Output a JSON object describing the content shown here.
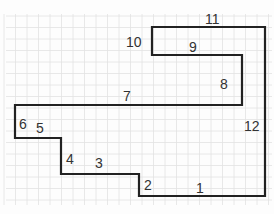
{
  "diagram": {
    "type": "rectilinear-polygon-on-grid-paper",
    "colors": {
      "grid": "#e2e2e2",
      "grid_major": "#d4d4d4",
      "outline": "#222222",
      "label": "#333333",
      "background": "#fdfdfd"
    },
    "vertices": [
      [
        139,
        196
      ],
      [
        265,
        196
      ],
      [
        265,
        27
      ],
      [
        152,
        27
      ],
      [
        152,
        55
      ],
      [
        242,
        55
      ],
      [
        242,
        105
      ],
      [
        15,
        105
      ],
      [
        15,
        138
      ],
      [
        61,
        138
      ],
      [
        61,
        174
      ],
      [
        139,
        174
      ]
    ],
    "side_labels": [
      {
        "id": "1",
        "text": "1",
        "x": 196,
        "y": 193
      },
      {
        "id": "2",
        "text": "2",
        "x": 144,
        "y": 190
      },
      {
        "id": "3",
        "text": "3",
        "x": 95,
        "y": 168
      },
      {
        "id": "4",
        "text": "4",
        "x": 66,
        "y": 164
      },
      {
        "id": "5",
        "text": "5",
        "x": 36,
        "y": 133
      },
      {
        "id": "6",
        "text": "6",
        "x": 19,
        "y": 129
      },
      {
        "id": "7",
        "text": "7",
        "x": 123,
        "y": 101
      },
      {
        "id": "8",
        "text": "8",
        "x": 220,
        "y": 89
      },
      {
        "id": "9",
        "text": "9",
        "x": 189,
        "y": 52
      },
      {
        "id": "10",
        "text": "10",
        "x": 126,
        "y": 47
      },
      {
        "id": "11",
        "text": "11",
        "x": 205,
        "y": 24
      },
      {
        "id": "12",
        "text": "12",
        "x": 244,
        "y": 131
      }
    ]
  }
}
